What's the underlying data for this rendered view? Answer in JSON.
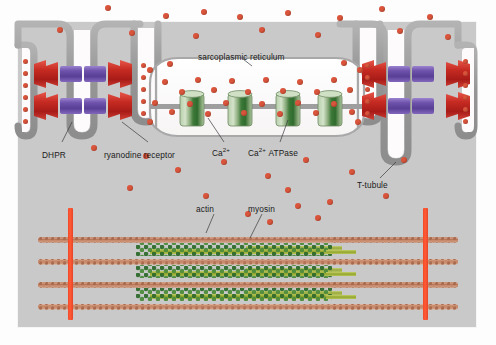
{
  "figure": {
    "background_color": "#fdfdfd",
    "panel_color": "#c9c9c9",
    "extracellular_color": "#fbfbfb"
  },
  "labels": {
    "sarcoplasmic_reticulum": "sarcoplasmic reticulum",
    "dhpr": "DHPR",
    "ryanodine_receptor": "ryanodine receptor",
    "calcium": "Ca",
    "calcium_charge": "2+",
    "calcium_atpase": "ATPase",
    "t_tubule": "T-tubule",
    "actin": "actin",
    "myosin": "myosin"
  },
  "colors": {
    "calcium_ion": "#d9543b",
    "dhpr_red": "#c0261f",
    "dhpr_red_light": "#e0453a",
    "ryr_purple": "#6b4fa8",
    "ryr_purple_light": "#8f74c8",
    "atpase_green": "#9db98c",
    "atpase_green_dark": "#3f7a3a",
    "membrane_gray": "#9a9a9a",
    "lumen_white": "#fdfbfb",
    "z_line_red": "#f0492a",
    "actin_tan": "#c08a6e",
    "myosin_green": "#3f7a3a",
    "myosin_rod": "#8c9c32"
  },
  "structures": {
    "dhpr_count": 8,
    "ryanodine_rod_count": 8,
    "atpase_channels": 4,
    "t_tubules": 4,
    "actin_filaments": 4,
    "myosin_filaments": 3,
    "z_lines": 2
  },
  "ions": {
    "cytosol_top": [
      {
        "x": 108,
        "y": 8
      },
      {
        "x": 166,
        "y": 16
      },
      {
        "x": 204,
        "y": 12
      },
      {
        "x": 240,
        "y": 17
      },
      {
        "x": 288,
        "y": 13
      },
      {
        "x": 340,
        "y": 18
      },
      {
        "x": 382,
        "y": 9
      },
      {
        "x": 430,
        "y": 17
      },
      {
        "x": 60,
        "y": 30
      },
      {
        "x": 132,
        "y": 33
      },
      {
        "x": 196,
        "y": 36
      },
      {
        "x": 262,
        "y": 30
      },
      {
        "x": 318,
        "y": 35
      },
      {
        "x": 400,
        "y": 31
      },
      {
        "x": 448,
        "y": 37
      }
    ],
    "sr_lumen": [
      {
        "x": 165,
        "y": 82
      },
      {
        "x": 182,
        "y": 92
      },
      {
        "x": 198,
        "y": 80
      },
      {
        "x": 214,
        "y": 90
      },
      {
        "x": 232,
        "y": 81
      },
      {
        "x": 248,
        "y": 92
      },
      {
        "x": 266,
        "y": 80
      },
      {
        "x": 283,
        "y": 91
      },
      {
        "x": 300,
        "y": 82
      },
      {
        "x": 317,
        "y": 92
      },
      {
        "x": 334,
        "y": 80
      },
      {
        "x": 350,
        "y": 90
      },
      {
        "x": 155,
        "y": 103
      },
      {
        "x": 172,
        "y": 112
      },
      {
        "x": 190,
        "y": 104
      },
      {
        "x": 208,
        "y": 114
      },
      {
        "x": 226,
        "y": 103
      },
      {
        "x": 244,
        "y": 113
      },
      {
        "x": 262,
        "y": 104
      },
      {
        "x": 280,
        "y": 114
      },
      {
        "x": 298,
        "y": 103
      },
      {
        "x": 316,
        "y": 113
      },
      {
        "x": 334,
        "y": 104
      },
      {
        "x": 352,
        "y": 112
      },
      {
        "x": 150,
        "y": 70
      },
      {
        "x": 170,
        "y": 64
      },
      {
        "x": 360,
        "y": 70
      },
      {
        "x": 344,
        "y": 63
      },
      {
        "x": 150,
        "y": 122
      },
      {
        "x": 358,
        "y": 122
      }
    ],
    "cytosol_mid": [
      {
        "x": 94,
        "y": 148
      },
      {
        "x": 146,
        "y": 156
      },
      {
        "x": 178,
        "y": 170
      },
      {
        "x": 224,
        "y": 162
      },
      {
        "x": 268,
        "y": 176
      },
      {
        "x": 306,
        "y": 160
      },
      {
        "x": 352,
        "y": 172
      },
      {
        "x": 404,
        "y": 160
      },
      {
        "x": 130,
        "y": 188
      },
      {
        "x": 206,
        "y": 196
      },
      {
        "x": 288,
        "y": 190
      },
      {
        "x": 330,
        "y": 202
      },
      {
        "x": 386,
        "y": 196
      },
      {
        "x": 248,
        "y": 214
      },
      {
        "x": 298,
        "y": 206
      },
      {
        "x": 270,
        "y": 222
      },
      {
        "x": 318,
        "y": 218
      }
    ],
    "t_tubule_lumen": [
      {
        "x": 26,
        "y": 62
      },
      {
        "x": 26,
        "y": 74
      },
      {
        "x": 26,
        "y": 86
      },
      {
        "x": 26,
        "y": 98
      },
      {
        "x": 26,
        "y": 110
      },
      {
        "x": 26,
        "y": 122
      },
      {
        "x": 144,
        "y": 66
      },
      {
        "x": 144,
        "y": 78
      },
      {
        "x": 144,
        "y": 90
      },
      {
        "x": 144,
        "y": 102
      },
      {
        "x": 144,
        "y": 114
      },
      {
        "x": 368,
        "y": 66
      },
      {
        "x": 368,
        "y": 78
      },
      {
        "x": 368,
        "y": 90
      },
      {
        "x": 368,
        "y": 102
      },
      {
        "x": 368,
        "y": 114
      },
      {
        "x": 466,
        "y": 62
      },
      {
        "x": 466,
        "y": 74
      },
      {
        "x": 466,
        "y": 86
      },
      {
        "x": 466,
        "y": 98
      },
      {
        "x": 466,
        "y": 110
      },
      {
        "x": 466,
        "y": 122
      }
    ]
  },
  "dhpr_units": [
    {
      "x": 30,
      "y": 72,
      "flip": false
    },
    {
      "x": 30,
      "y": 104,
      "flip": false
    },
    {
      "x": 110,
      "y": 72,
      "flip": true
    },
    {
      "x": 110,
      "y": 104,
      "flip": true
    },
    {
      "x": 370,
      "y": 72,
      "flip": false
    },
    {
      "x": 370,
      "y": 104,
      "flip": false
    },
    {
      "x": 448,
      "y": 72,
      "flip": true
    },
    {
      "x": 448,
      "y": 104,
      "flip": true
    }
  ],
  "atpase_positions": [
    {
      "x": 184,
      "y": 96
    },
    {
      "x": 232,
      "y": 96
    },
    {
      "x": 280,
      "y": 96
    },
    {
      "x": 322,
      "y": 96
    }
  ],
  "sarcomere": {
    "z_lines": [
      {
        "x": 70
      },
      {
        "x": 424
      }
    ],
    "actin_rows": [
      240,
      262,
      285,
      307
    ],
    "myosin_rows": [
      251,
      273,
      296
    ],
    "actin_left_start": 38,
    "actin_right_end": 458,
    "myosin_start": 150,
    "myosin_end": 330
  }
}
